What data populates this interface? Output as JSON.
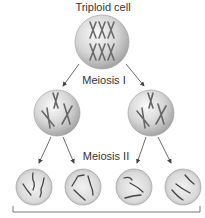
{
  "diagram": {
    "title": "Triploid cell",
    "stage1_label": "Meiosis I",
    "stage2_label": "Meiosis II",
    "colors": {
      "cell_fill_light": "#f4f4f4",
      "cell_fill_dark": "#a8a8a8",
      "cell_outline": "#8a8a8a",
      "chromosome": "#5a5a5a",
      "arrow": "#444444",
      "bracket": "#555555"
    },
    "nodes": [
      {
        "id": "parent",
        "label": "Triploid cell",
        "chromosomes": 6
      },
      {
        "id": "meiosis1-left",
        "chromosomes": 3
      },
      {
        "id": "meiosis1-right",
        "chromosomes": 3
      },
      {
        "id": "meiosis2-cell-1",
        "chromosomes": 3
      },
      {
        "id": "meiosis2-cell-2",
        "chromosomes": 3
      },
      {
        "id": "meiosis2-cell-3",
        "chromosomes": 3
      },
      {
        "id": "meiosis2-cell-4",
        "chromosomes": 3
      }
    ]
  }
}
